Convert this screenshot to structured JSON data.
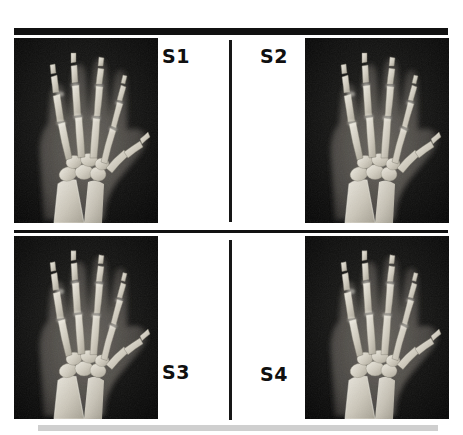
{
  "figure": {
    "panels": [
      {
        "id": "S1",
        "label": "S1",
        "image": "hand-xray",
        "label_position": "top-right",
        "image_position": "left"
      },
      {
        "id": "S2",
        "label": "S2",
        "image": "hand-xray",
        "label_position": "top-left",
        "image_position": "right"
      },
      {
        "id": "S3",
        "label": "S3",
        "image": "hand-xray",
        "label_position": "bottom-right",
        "image_position": "left"
      },
      {
        "id": "S4",
        "label": "S4",
        "image": "hand-xray",
        "label_position": "bottom-left",
        "image_position": "right"
      }
    ],
    "colors": {
      "rule": "#111111",
      "divider": "#161616",
      "bottom_bar": "#cfcfcf",
      "xray_background": "#0c0c0c",
      "bone": "#d8d4cb",
      "soft_tissue": "#4a4a48",
      "page_background": "#ffffff"
    }
  }
}
